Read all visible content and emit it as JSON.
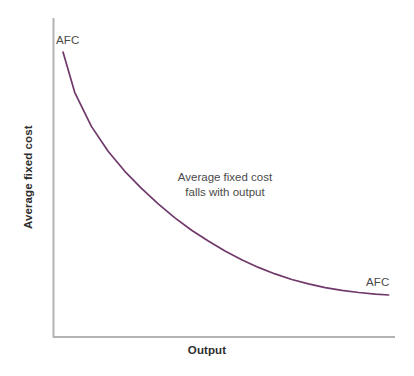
{
  "chart_data": {
    "type": "line",
    "title": "",
    "xlabel": "Output",
    "ylabel": "Average fixed cost",
    "grid": false,
    "legend": "none",
    "axis_ticks": {
      "x": [],
      "y": []
    },
    "xlim": [
      0,
      100
    ],
    "ylim": [
      0,
      100
    ],
    "annotations": [
      {
        "name": "afc-label-top",
        "text": "AFC",
        "x": 2,
        "y": 92
      },
      {
        "name": "curve-annotation",
        "text": "Average fixed cost falls with output",
        "line1": "Average fixed cost",
        "line2": "falls with output",
        "x": 38,
        "y": 50
      },
      {
        "name": "afc-label-bottom",
        "text": "AFC",
        "x": 92,
        "y": 17
      }
    ],
    "series": [
      {
        "name": "AFC",
        "color": "#70396B",
        "x": [
          1.5,
          5,
          10,
          15,
          20,
          25,
          30,
          35,
          40,
          45,
          50,
          55,
          60,
          65,
          70,
          75,
          80,
          85,
          90,
          95,
          99
        ],
        "y": [
          91.0,
          78.0,
          67.0,
          59.0,
          52.5,
          47.0,
          42.0,
          37.5,
          33.5,
          30.0,
          26.8,
          24.0,
          21.5,
          19.4,
          17.6,
          16.2,
          15.0,
          14.1,
          13.4,
          12.9,
          12.6
        ]
      }
    ]
  },
  "colors": {
    "curve": "#70396B",
    "axis": "#b3b3b3",
    "label_text": "#4a4a4a",
    "title_text": "#2e2e2e",
    "background": "#ffffff"
  }
}
